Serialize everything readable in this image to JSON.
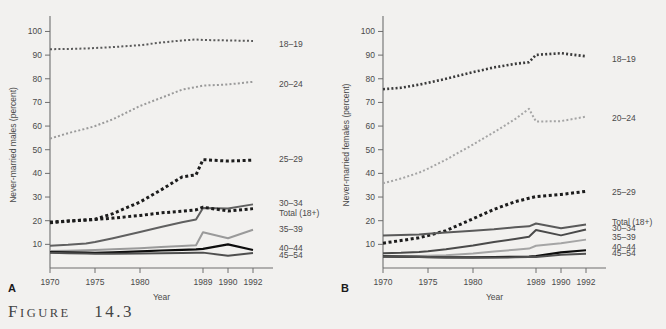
{
  "figure": {
    "caption_prefix": "F",
    "caption_text": "IGURE",
    "caption_number": "14.3",
    "background_color": "#f2f1ef"
  },
  "panels": [
    {
      "letter": "A",
      "ylabel": "Never-married males (percent)",
      "xlabel": "Year"
    },
    {
      "letter": "B",
      "ylabel": "Never-married females (percent)",
      "xlabel": "Year"
    }
  ],
  "chart_data": [
    {
      "type": "line",
      "title": "",
      "panel": "A",
      "xlabel": "Year",
      "ylabel": "Never-married males (percent)",
      "xticklabels": [
        "1970",
        "1975",
        "1980",
        "1989",
        "1990",
        "1992"
      ],
      "xtickvalues": [
        1970,
        1975,
        1980,
        1989,
        1990,
        1992
      ],
      "yticklabels": [
        "10",
        "20",
        "30",
        "40",
        "50",
        "60",
        "70",
        "80",
        "90",
        "100"
      ],
      "ytickvalues": [
        10,
        20,
        30,
        40,
        50,
        60,
        70,
        80,
        90,
        100
      ],
      "ylim": [
        0,
        104
      ],
      "xlim": [
        1970,
        1992
      ],
      "grid": false,
      "legend_position": "right-inline",
      "x": [
        1970,
        1972,
        1974,
        1975,
        1977,
        1980,
        1983,
        1986,
        1988,
        1989,
        1990,
        1992
      ],
      "series": [
        {
          "name": "18-19",
          "label": "18–19",
          "color": "#5a5a5a",
          "style": "dotted",
          "width": 2.0,
          "label_y": 94.8,
          "values": [
            92.5,
            92.6,
            92.8,
            93.0,
            93.4,
            94.2,
            95.3,
            96.2,
            96.6,
            96.4,
            96.2,
            96.0
          ]
        },
        {
          "name": "20-24",
          "label": "20–24",
          "color": "#9a9a9a",
          "style": "dotted",
          "width": 2.0,
          "label_y": 78.0,
          "values": [
            54.7,
            57.0,
            58.9,
            60.0,
            62.9,
            68.5,
            71.9,
            75.4,
            76.5,
            77.1,
            77.6,
            78.7
          ]
        },
        {
          "name": "25-29",
          "label": "25–29",
          "color": "#1c1c1c",
          "style": "dotted",
          "width": 3.0,
          "label_y": 46.0,
          "values": [
            19.1,
            19.8,
            20.3,
            20.6,
            23.0,
            27.9,
            33.0,
            38.5,
            39.4,
            45.8,
            45.2,
            45.6
          ]
        },
        {
          "name": "30-34",
          "label": "30–34",
          "color": "#606060",
          "style": "solid",
          "width": 2.0,
          "label_y": 27.5,
          "values": [
            9.4,
            9.8,
            10.4,
            11.0,
            12.6,
            15.2,
            17.3,
            19.3,
            20.5,
            25.4,
            25.2,
            26.9
          ]
        },
        {
          "name": "Total (18+)",
          "label": "Total (18+)",
          "color": "#1c1c1c",
          "style": "dotted",
          "width": 3.0,
          "label_y": 23.3,
          "values": [
            19.4,
            19.9,
            20.3,
            20.5,
            21.1,
            22.2,
            23.3,
            24.0,
            24.6,
            25.7,
            24.1,
            25.1
          ]
        },
        {
          "name": "35-39",
          "label": "35–39",
          "color": "#9a9a9a",
          "style": "solid",
          "width": 2.0,
          "label_y": 16.5,
          "values": [
            7.2,
            7.3,
            7.5,
            7.6,
            7.9,
            8.4,
            8.9,
            9.3,
            9.6,
            15.1,
            12.6,
            16.2
          ]
        },
        {
          "name": "40-44",
          "label": "40–44",
          "color": "#0d0d0d",
          "style": "solid",
          "width": 2.2,
          "label_y": 8.4,
          "values": [
            6.7,
            6.6,
            6.5,
            6.4,
            6.6,
            7.0,
            7.4,
            7.7,
            7.9,
            8.1,
            10.0,
            7.6
          ]
        },
        {
          "name": "45-54",
          "label": "45–54",
          "color": "#4f4f4f",
          "style": "solid",
          "width": 2.0,
          "label_y": 5.4,
          "values": [
            6.4,
            6.2,
            6.1,
            6.0,
            6.0,
            6.1,
            6.2,
            6.3,
            6.4,
            6.5,
            5.2,
            6.3
          ]
        }
      ]
    },
    {
      "type": "line",
      "title": "",
      "panel": "B",
      "xlabel": "Year",
      "ylabel": "Never-married females (percent)",
      "xticklabels": [
        "1970",
        "1975",
        "1980",
        "1989",
        "1990",
        "1992"
      ],
      "xtickvalues": [
        1970,
        1975,
        1980,
        1989,
        1990,
        1992
      ],
      "yticklabels": [
        "10",
        "20",
        "30",
        "40",
        "50",
        "60",
        "70",
        "80",
        "90",
        "100"
      ],
      "ytickvalues": [
        10,
        20,
        30,
        40,
        50,
        60,
        70,
        80,
        90,
        100
      ],
      "ylim": [
        0,
        104
      ],
      "xlim": [
        1970,
        1992
      ],
      "grid": false,
      "legend_position": "right-inline",
      "x": [
        1970,
        1972,
        1974,
        1975,
        1977,
        1980,
        1983,
        1986,
        1988,
        1989,
        1990,
        1992
      ],
      "series": [
        {
          "name": "18-19",
          "label": "18–19",
          "color": "#3a3a3a",
          "style": "dotted",
          "width": 2.6,
          "label_y": 88.5,
          "values": [
            75.6,
            76.2,
            77.5,
            78.3,
            80.0,
            82.8,
            84.8,
            86.3,
            87.0,
            90.1,
            90.8,
            89.5
          ]
        },
        {
          "name": "20-24",
          "label": "20–24",
          "color": "#a5a5a5",
          "style": "dotted",
          "width": 2.0,
          "label_y": 63.5,
          "values": [
            35.8,
            37.8,
            40.3,
            42.0,
            45.8,
            52.2,
            57.4,
            62.9,
            67.3,
            61.9,
            62.1,
            64.0
          ]
        },
        {
          "name": "25-29",
          "label": "25–29",
          "color": "#1c1c1c",
          "style": "dotted",
          "width": 3.0,
          "label_y": 32.0,
          "values": [
            10.5,
            11.6,
            12.8,
            13.7,
            15.8,
            20.8,
            24.8,
            28.0,
            29.5,
            30.2,
            31.1,
            32.4
          ]
        },
        {
          "name": "Total (18+)",
          "label": "Total (18+)",
          "color": "#5a5a5a",
          "style": "solid",
          "width": 2.0,
          "label_y": 19.5,
          "values": [
            13.7,
            13.9,
            14.2,
            14.5,
            15.0,
            15.8,
            16.4,
            17.2,
            17.6,
            18.8,
            16.8,
            18.4
          ]
        },
        {
          "name": "30-34",
          "label": "30–34",
          "color": "#4a4a4a",
          "style": "solid",
          "width": 2.0,
          "label_y": 17.0,
          "values": [
            6.2,
            6.4,
            6.8,
            7.1,
            7.9,
            9.5,
            11.0,
            12.3,
            13.2,
            16.1,
            13.8,
            16.3
          ]
        },
        {
          "name": "35-39",
          "label": "35–39",
          "color": "#a5a5a5",
          "style": "solid",
          "width": 2.0,
          "label_y": 13.3,
          "values": [
            4.9,
            5.0,
            5.1,
            5.2,
            5.4,
            6.1,
            7.0,
            7.7,
            8.2,
            9.4,
            10.5,
            12.0
          ]
        },
        {
          "name": "40-44",
          "label": "40–44",
          "color": "#0d0d0d",
          "style": "solid",
          "width": 2.2,
          "label_y": 9.0,
          "values": [
            4.9,
            4.8,
            4.7,
            4.6,
            4.5,
            4.5,
            4.6,
            4.7,
            4.8,
            5.0,
            6.6,
            7.5
          ]
        },
        {
          "name": "45-54",
          "label": "45–54",
          "color": "#505050",
          "style": "solid",
          "width": 2.0,
          "label_y": 6.3,
          "values": [
            4.9,
            4.8,
            4.7,
            4.6,
            4.5,
            4.4,
            4.4,
            4.5,
            4.6,
            4.7,
            5.6,
            6.0
          ]
        }
      ]
    }
  ]
}
